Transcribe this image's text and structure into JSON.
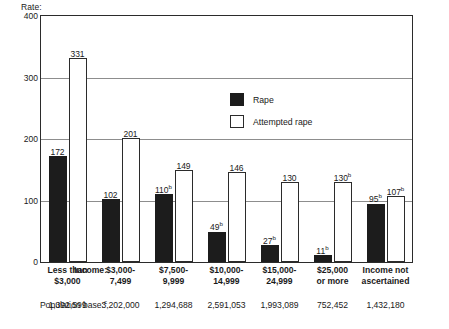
{
  "chart_data": {
    "type": "bar",
    "title": "",
    "ylabel": "Rate:",
    "xlabel": "Income:",
    "ylim": [
      0,
      400
    ],
    "yticks": [
      0,
      100,
      200,
      300,
      400
    ],
    "ytick_labels": [
      "0",
      "100",
      "200",
      "300",
      "400"
    ],
    "grid": true,
    "legend_position": "upper-center-right",
    "categories": [
      "Less than\n$3,000",
      "$3,000-\n7,499",
      "$7,500-\n9,999",
      "$10,000-\n14,999",
      "$15,000-\n24,999",
      "$25,000\nor more",
      "Income not\nascertained"
    ],
    "category_lines": [
      [
        "Less than",
        "$3,000"
      ],
      [
        "$3,000-",
        "7,499"
      ],
      [
        "$7,500-",
        "9,999"
      ],
      [
        "$10,000-",
        "14,999"
      ],
      [
        "$15,000-",
        "24,999"
      ],
      [
        "$25,000",
        "or more"
      ],
      [
        "Income not",
        "ascertained"
      ]
    ],
    "series": [
      {
        "name": "Rape",
        "style": "solid",
        "color": "#1c1c1c",
        "values": [
          172,
          102,
          110,
          49,
          27,
          11,
          95
        ],
        "labels": [
          "172",
          "102",
          "110",
          "49",
          "27",
          "11",
          "95"
        ],
        "footnotes": [
          "",
          "",
          "b",
          "b",
          "b",
          "b",
          "b"
        ]
      },
      {
        "name": "Attempted rape",
        "style": "hollow",
        "color": "#ffffff",
        "values": [
          331,
          201,
          149,
          146,
          130,
          130,
          107
        ],
        "labels": [
          "331",
          "201",
          "149",
          "146",
          "130",
          "130",
          "107"
        ],
        "footnotes": [
          "",
          "",
          "",
          "",
          "",
          "b",
          "b"
        ]
      }
    ],
    "population_base_label": "Population base:",
    "population_base_footnote": "c",
    "population_base": [
      "1,392,599",
      "3,202,000",
      "1,294,688",
      "2,591,053",
      "1,993,089",
      "752,452",
      "1,432,180"
    ]
  },
  "legend": {
    "items": [
      {
        "label": "Rape",
        "style": "solid"
      },
      {
        "label": "Attempted rape",
        "style": "hollow"
      }
    ]
  }
}
